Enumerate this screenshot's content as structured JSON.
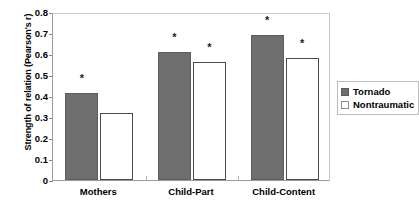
{
  "chart_data": {
    "type": "bar",
    "title": "",
    "xlabel": "",
    "ylabel": "Strength of relation (Pearson's r)",
    "ylim": [
      0,
      0.8
    ],
    "yticks": [
      "0",
      "0.1",
      "0.2",
      "0.3",
      "0.4",
      "0.5",
      "0.6",
      "0.7",
      "0.8"
    ],
    "ytick_values": [
      0,
      0.1,
      0.2,
      0.3,
      0.4,
      0.5,
      0.6,
      0.7,
      0.8
    ],
    "grid": false,
    "legend_position": "right",
    "categories": [
      "Mothers",
      "Child-Part",
      "Child-Content"
    ],
    "series": [
      {
        "name": "Tornado",
        "color": "#6e6e6e",
        "values": [
          0.415,
          0.61,
          0.69
        ],
        "significance": [
          "*",
          "*",
          "*"
        ]
      },
      {
        "name": "Nontraumatic",
        "color": "#ffffff",
        "values": [
          0.32,
          0.56,
          0.58
        ],
        "significance": [
          "",
          "*",
          "*"
        ]
      }
    ],
    "annotations": {
      "significance_marker": "*"
    }
  },
  "legend": {
    "items": [
      {
        "label": "Tornado",
        "swatch": "filled-gray-square"
      },
      {
        "label": "Nontraumatic",
        "swatch": "empty-white-square"
      }
    ]
  },
  "colors": {
    "tornado_fill": "#6e6e6e",
    "nontraumatic_fill": "#ffffff",
    "axis": "#9a9a9a",
    "text": "#000000"
  }
}
